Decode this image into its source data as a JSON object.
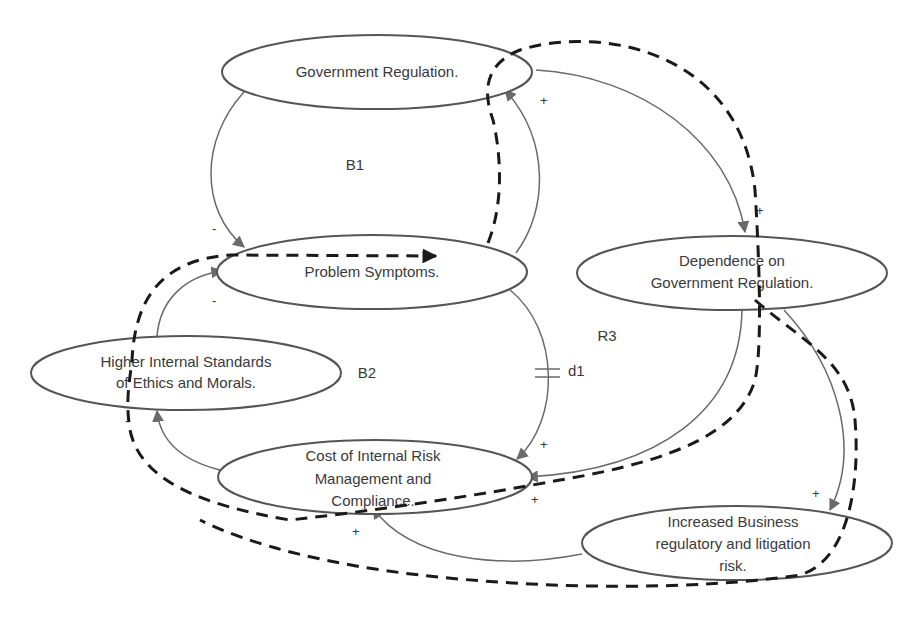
{
  "diagram": {
    "type": "causal-loop-diagram",
    "nodes": [
      {
        "id": "gov_reg",
        "lines": [
          "Government Regulation."
        ]
      },
      {
        "id": "problem",
        "lines": [
          "Problem Symptoms."
        ]
      },
      {
        "id": "dependence",
        "lines": [
          "Dependence on",
          "Government Regulation."
        ]
      },
      {
        "id": "ethics",
        "lines": [
          "Higher Internal Standards",
          "of Ethics and Morals."
        ]
      },
      {
        "id": "cost",
        "lines": [
          "Cost of Internal Risk",
          "Management and",
          "Compliance."
        ]
      },
      {
        "id": "risk",
        "lines": [
          "Increased Business",
          "regulatory and litigation",
          "risk."
        ]
      }
    ],
    "loops": [
      {
        "id": "B1",
        "label": "B1"
      },
      {
        "id": "B2",
        "label": "B2"
      },
      {
        "id": "R3",
        "label": "R3"
      }
    ],
    "delay": {
      "label": "d1"
    },
    "edges": [
      {
        "from": "gov_reg",
        "to": "problem",
        "polarity": "-"
      },
      {
        "from": "problem",
        "to": "gov_reg",
        "polarity": "+"
      },
      {
        "from": "gov_reg",
        "to": "dependence",
        "polarity": "+"
      },
      {
        "from": "problem",
        "to": "cost",
        "polarity": "+",
        "delay": "d1"
      },
      {
        "from": "dependence",
        "to": "cost",
        "polarity": ""
      },
      {
        "from": "dependence",
        "to": "risk",
        "polarity": "+"
      },
      {
        "from": "risk",
        "to": "cost",
        "polarity": "+"
      },
      {
        "from": "cost",
        "to": "ethics",
        "polarity": "-"
      },
      {
        "from": "ethics",
        "to": "problem",
        "polarity": "-"
      }
    ],
    "signs": {
      "plus": "+",
      "minus": "-"
    }
  }
}
